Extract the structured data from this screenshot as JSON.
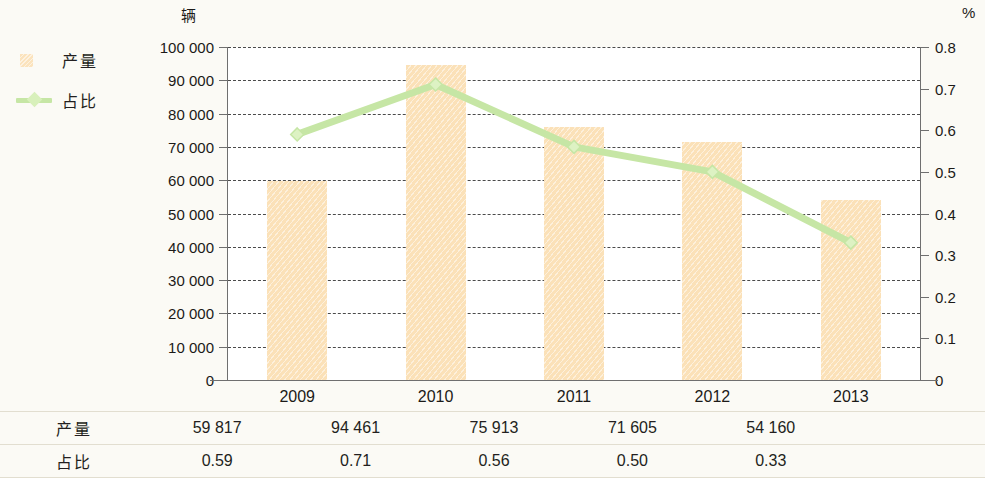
{
  "units": {
    "left_axis": "辆",
    "right_axis": "%"
  },
  "legend": {
    "items": [
      {
        "label": "产量",
        "type": "bar",
        "color": "#fbe1b8",
        "icon": "bar-swatch-icon"
      },
      {
        "label": "占比",
        "type": "line",
        "color": "#c6e6a5",
        "icon": "line-marker-icon"
      }
    ]
  },
  "table": {
    "rows": [
      {
        "header": "产量",
        "values": [
          "59 817",
          "94 461",
          "75 913",
          "71 605",
          "54 160"
        ]
      },
      {
        "header": "占比",
        "values": [
          "0.59",
          "0.71",
          "0.56",
          "0.50",
          "0.33"
        ]
      }
    ]
  },
  "chart_data": {
    "type": "bar",
    "title": "",
    "subtitle": "",
    "xlabel": "",
    "categories": [
      "2009",
      "2010",
      "2011",
      "2012",
      "2013"
    ],
    "series": [
      {
        "name": "产量",
        "type": "bar",
        "axis": "left",
        "unit": "辆",
        "color": "#fbe1b8",
        "values": [
          59817,
          94461,
          75913,
          71605,
          54160
        ]
      },
      {
        "name": "占比",
        "type": "line",
        "axis": "right",
        "unit": "%",
        "color": "#c6e6a5",
        "values": [
          0.59,
          0.71,
          0.56,
          0.5,
          0.33
        ]
      }
    ],
    "y_left": {
      "label": "辆",
      "ylim": [
        0,
        100000
      ],
      "ticks": [
        0,
        10000,
        20000,
        30000,
        40000,
        50000,
        60000,
        70000,
        80000,
        90000,
        100000
      ],
      "tick_labels": [
        "0",
        "10 000",
        "20 000",
        "30 000",
        "40 000",
        "50 000",
        "60 000",
        "70 000",
        "80 000",
        "90 000",
        "100 000"
      ]
    },
    "y_right": {
      "label": "%",
      "ylim": [
        0,
        0.8
      ],
      "ticks": [
        0,
        0.1,
        0.2,
        0.3,
        0.4,
        0.5,
        0.6,
        0.7,
        0.8
      ],
      "tick_labels": [
        "0",
        "0.1",
        "0.2",
        "0.3",
        "0.4",
        "0.5",
        "0.6",
        "0.7",
        "0.8"
      ]
    },
    "grid": true,
    "grid_style": "dashed",
    "legend_position": "left-outside"
  }
}
